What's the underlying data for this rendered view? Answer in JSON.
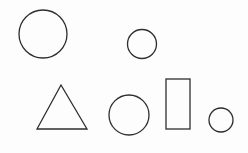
{
  "document": {
    "type": "shapes-worksheet",
    "shapes": [
      {
        "id": "large-circle",
        "kind": "circle",
        "size": "large"
      },
      {
        "id": "small-circle-top",
        "kind": "circle",
        "size": "small"
      },
      {
        "id": "triangle",
        "kind": "triangle",
        "size": "medium"
      },
      {
        "id": "medium-circle",
        "kind": "circle",
        "size": "medium"
      },
      {
        "id": "rectangle",
        "kind": "rectangle",
        "size": "medium"
      },
      {
        "id": "small-circle-bottom",
        "kind": "circle",
        "size": "small"
      }
    ],
    "stroke_color": "#2e2e2e"
  }
}
